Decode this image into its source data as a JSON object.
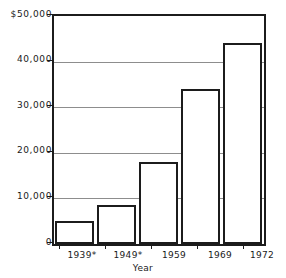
{
  "chart_data": {
    "type": "bar",
    "title": "",
    "xlabel": "Year",
    "ylabel": "",
    "categories": [
      "1939*",
      "1949*",
      "1959",
      "1969",
      "1972"
    ],
    "values": [
      5000,
      8500,
      18000,
      34000,
      44000
    ],
    "ylim": [
      0,
      50000
    ],
    "y_ticks": [
      0,
      10000,
      20000,
      30000,
      40000,
      50000
    ],
    "y_tick_labels": [
      "0",
      "10,000",
      "20,000",
      "30,000",
      "40,000",
      "$50,000"
    ],
    "grid": true,
    "grid_axis": "y",
    "legend": "none",
    "bar_facecolor": "#ffffff",
    "bar_edgecolor": "#1c1c1c",
    "gridline_color": "#8d8d8d",
    "axis_color": "#1c1c1c",
    "footnote_marker": "*"
  },
  "axes": {
    "y": {
      "ticks": [
        {
          "label": "$50,000",
          "value": 50000
        },
        {
          "label": "40,000",
          "value": 40000
        },
        {
          "label": "30,000",
          "value": 30000
        },
        {
          "label": "20,000",
          "value": 20000
        },
        {
          "label": "10,000",
          "value": 10000
        },
        {
          "label": "0",
          "value": 0
        }
      ]
    },
    "x": {
      "title": "Year",
      "ticks": [
        {
          "label": "1939*"
        },
        {
          "label": "1949*"
        },
        {
          "label": "1959"
        },
        {
          "label": "1969"
        },
        {
          "label": "1972"
        }
      ]
    }
  }
}
